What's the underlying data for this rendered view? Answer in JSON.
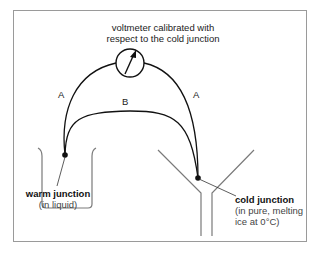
{
  "diagram": {
    "voltmeter_label_line1": "voltmeter calibrated with",
    "voltmeter_label_line2": "respect to the cold junction",
    "wire_a_left": "A",
    "wire_a_right": "A",
    "wire_b": "B",
    "warm_junction": {
      "label": "warm junction",
      "note": "(in liquid)"
    },
    "cold_junction": {
      "label": "cold junction",
      "note_line1": "(in pure, melting",
      "note_line2": "ice at 0°C)"
    },
    "colors": {
      "wire": "#111111",
      "vessel": "#7a7a7a",
      "frame": "#9a9a9a"
    }
  }
}
